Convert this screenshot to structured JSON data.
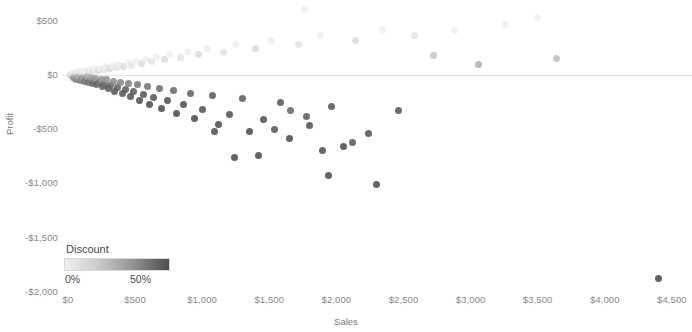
{
  "chart_data": {
    "type": "scatter",
    "title": "",
    "xlabel": "Sales",
    "ylabel": "Profit",
    "xlim": [
      0,
      4600
    ],
    "ylim": [
      -2000,
      700
    ],
    "grid": false,
    "zero_line": true,
    "x_ticks": [
      "$0",
      "$500",
      "$1,000",
      "$1,500",
      "$2,000",
      "$2,500",
      "$3,000",
      "$3,500",
      "$4,000",
      "$4,500"
    ],
    "x_tick_values": [
      0,
      500,
      1000,
      1500,
      2000,
      2500,
      3000,
      3500,
      4000,
      4500
    ],
    "y_ticks": [
      "$500",
      "$0",
      "-$500",
      "-$1,000",
      "-$1,500",
      "-$2,000"
    ],
    "y_tick_values": [
      500,
      0,
      -500,
      -1000,
      -1500,
      -2000
    ],
    "color_encoding": {
      "field": "Discount",
      "min_label": "0%",
      "max_label": "50%",
      "min_value": 0,
      "max_value": 50,
      "min_color": "#f0f0f0",
      "max_color": "#4f4f4f",
      "legend_position": "bottom-left"
    },
    "marker": {
      "shape": "circle",
      "size_px": 7,
      "opacity": 0.85
    },
    "series": [
      {
        "name": "Orders",
        "points": [
          {
            "x": 18,
            "y": 6,
            "d": 2
          },
          {
            "x": 22,
            "y": -4,
            "d": 6
          },
          {
            "x": 26,
            "y": 10,
            "d": 0
          },
          {
            "x": 30,
            "y": -14,
            "d": 14
          },
          {
            "x": 34,
            "y": 4,
            "d": 4
          },
          {
            "x": 38,
            "y": -22,
            "d": 20
          },
          {
            "x": 42,
            "y": 16,
            "d": 0
          },
          {
            "x": 46,
            "y": -8,
            "d": 12
          },
          {
            "x": 50,
            "y": -30,
            "d": 26
          },
          {
            "x": 54,
            "y": 12,
            "d": 2
          },
          {
            "x": 58,
            "y": -18,
            "d": 18
          },
          {
            "x": 62,
            "y": 22,
            "d": 0
          },
          {
            "x": 66,
            "y": -40,
            "d": 30
          },
          {
            "x": 70,
            "y": 8,
            "d": 6
          },
          {
            "x": 74,
            "y": -26,
            "d": 22
          },
          {
            "x": 80,
            "y": 30,
            "d": 0
          },
          {
            "x": 86,
            "y": -12,
            "d": 14
          },
          {
            "x": 92,
            "y": -48,
            "d": 32
          },
          {
            "x": 98,
            "y": 18,
            "d": 4
          },
          {
            "x": 104,
            "y": -34,
            "d": 26
          },
          {
            "x": 110,
            "y": 36,
            "d": 0
          },
          {
            "x": 116,
            "y": -20,
            "d": 18
          },
          {
            "x": 122,
            "y": -58,
            "d": 34
          },
          {
            "x": 128,
            "y": 24,
            "d": 2
          },
          {
            "x": 134,
            "y": -44,
            "d": 30
          },
          {
            "x": 140,
            "y": 42,
            "d": 0
          },
          {
            "x": 146,
            "y": -16,
            "d": 16
          },
          {
            "x": 152,
            "y": -66,
            "d": 36
          },
          {
            "x": 158,
            "y": 28,
            "d": 4
          },
          {
            "x": 164,
            "y": -52,
            "d": 32
          },
          {
            "x": 170,
            "y": 48,
            "d": 0
          },
          {
            "x": 176,
            "y": -24,
            "d": 20
          },
          {
            "x": 182,
            "y": -78,
            "d": 38
          },
          {
            "x": 188,
            "y": 34,
            "d": 2
          },
          {
            "x": 194,
            "y": -60,
            "d": 34
          },
          {
            "x": 200,
            "y": 56,
            "d": 0
          },
          {
            "x": 208,
            "y": -30,
            "d": 22
          },
          {
            "x": 216,
            "y": -92,
            "d": 40
          },
          {
            "x": 224,
            "y": 40,
            "d": 4
          },
          {
            "x": 232,
            "y": -72,
            "d": 36
          },
          {
            "x": 240,
            "y": 64,
            "d": 0
          },
          {
            "x": 248,
            "y": -38,
            "d": 24
          },
          {
            "x": 256,
            "y": -108,
            "d": 42
          },
          {
            "x": 264,
            "y": 48,
            "d": 2
          },
          {
            "x": 272,
            "y": -84,
            "d": 38
          },
          {
            "x": 280,
            "y": 74,
            "d": 0
          },
          {
            "x": 290,
            "y": -46,
            "d": 26
          },
          {
            "x": 300,
            "y": -126,
            "d": 44
          },
          {
            "x": 310,
            "y": 56,
            "d": 4
          },
          {
            "x": 320,
            "y": -98,
            "d": 40
          },
          {
            "x": 330,
            "y": 86,
            "d": 0
          },
          {
            "x": 340,
            "y": -56,
            "d": 28
          },
          {
            "x": 350,
            "y": -148,
            "d": 46
          },
          {
            "x": 360,
            "y": 66,
            "d": 2
          },
          {
            "x": 370,
            "y": -114,
            "d": 42
          },
          {
            "x": 380,
            "y": 98,
            "d": 0
          },
          {
            "x": 392,
            "y": -66,
            "d": 30
          },
          {
            "x": 404,
            "y": -172,
            "d": 46
          },
          {
            "x": 416,
            "y": 78,
            "d": 4
          },
          {
            "x": 428,
            "y": -132,
            "d": 44
          },
          {
            "x": 440,
            "y": 112,
            "d": 0
          },
          {
            "x": 452,
            "y": -78,
            "d": 32
          },
          {
            "x": 464,
            "y": -200,
            "d": 48
          },
          {
            "x": 476,
            "y": 92,
            "d": 2
          },
          {
            "x": 490,
            "y": -154,
            "d": 44
          },
          {
            "x": 504,
            "y": 128,
            "d": 0
          },
          {
            "x": 518,
            "y": -92,
            "d": 34
          },
          {
            "x": 532,
            "y": -232,
            "d": 48
          },
          {
            "x": 546,
            "y": 106,
            "d": 4
          },
          {
            "x": 560,
            "y": -178,
            "d": 46
          },
          {
            "x": 576,
            "y": 146,
            "d": 0
          },
          {
            "x": 592,
            "y": -108,
            "d": 36
          },
          {
            "x": 608,
            "y": -268,
            "d": 50
          },
          {
            "x": 624,
            "y": 124,
            "d": 2
          },
          {
            "x": 640,
            "y": -206,
            "d": 46
          },
          {
            "x": 660,
            "y": 166,
            "d": 0
          },
          {
            "x": 680,
            "y": -126,
            "d": 38
          },
          {
            "x": 700,
            "y": -308,
            "d": 50
          },
          {
            "x": 720,
            "y": 142,
            "d": 4
          },
          {
            "x": 740,
            "y": -238,
            "d": 48
          },
          {
            "x": 760,
            "y": 190,
            "d": 0
          },
          {
            "x": 785,
            "y": -146,
            "d": 40
          },
          {
            "x": 810,
            "y": -352,
            "d": 50
          },
          {
            "x": 835,
            "y": 162,
            "d": 2
          },
          {
            "x": 860,
            "y": -274,
            "d": 48
          },
          {
            "x": 888,
            "y": 216,
            "d": 0
          },
          {
            "x": 916,
            "y": -168,
            "d": 42
          },
          {
            "x": 944,
            "y": -402,
            "d": 50
          },
          {
            "x": 972,
            "y": 186,
            "d": 4
          },
          {
            "x": 1000,
            "y": -314,
            "d": 48
          },
          {
            "x": 1040,
            "y": 246,
            "d": 0
          },
          {
            "x": 1080,
            "y": -192,
            "d": 44
          },
          {
            "x": 1120,
            "y": -458,
            "d": 50
          },
          {
            "x": 1160,
            "y": 212,
            "d": 2
          },
          {
            "x": 1200,
            "y": -360,
            "d": 48
          },
          {
            "x": 1250,
            "y": 282,
            "d": 0
          },
          {
            "x": 1300,
            "y": -220,
            "d": 44
          },
          {
            "x": 1350,
            "y": -520,
            "d": 50
          },
          {
            "x": 1400,
            "y": 244,
            "d": 4
          },
          {
            "x": 1460,
            "y": -412,
            "d": 48
          },
          {
            "x": 1520,
            "y": 322,
            "d": 0
          },
          {
            "x": 1580,
            "y": -252,
            "d": 46
          },
          {
            "x": 1650,
            "y": -588,
            "d": 50
          },
          {
            "x": 1720,
            "y": 280,
            "d": 2
          },
          {
            "x": 1800,
            "y": -470,
            "d": 48
          },
          {
            "x": 1880,
            "y": 368,
            "d": 0
          },
          {
            "x": 1960,
            "y": -288,
            "d": 46
          },
          {
            "x": 2050,
            "y": -664,
            "d": 50
          },
          {
            "x": 2140,
            "y": 320,
            "d": 4
          },
          {
            "x": 2240,
            "y": -536,
            "d": 48
          },
          {
            "x": 2340,
            "y": 420,
            "d": 0
          },
          {
            "x": 2460,
            "y": -330,
            "d": 46
          },
          {
            "x": 2580,
            "y": 364,
            "d": 2
          },
          {
            "x": 2720,
            "y": 180,
            "d": 10
          },
          {
            "x": 2880,
            "y": 412,
            "d": 0
          },
          {
            "x": 3060,
            "y": 96,
            "d": 16
          },
          {
            "x": 3260,
            "y": 468,
            "d": 0
          },
          {
            "x": 3500,
            "y": 530,
            "d": 0
          },
          {
            "x": 3640,
            "y": 148,
            "d": 12
          },
          {
            "x": 4400,
            "y": -1880,
            "d": 50
          },
          {
            "x": 1760,
            "y": 600,
            "d": 0
          },
          {
            "x": 1940,
            "y": -930,
            "d": 50
          },
          {
            "x": 2300,
            "y": -1010,
            "d": 50
          },
          {
            "x": 1900,
            "y": -700,
            "d": 48
          },
          {
            "x": 2120,
            "y": -620,
            "d": 46
          },
          {
            "x": 1240,
            "y": -760,
            "d": 50
          },
          {
            "x": 1420,
            "y": -740,
            "d": 50
          },
          {
            "x": 1090,
            "y": -520,
            "d": 48
          },
          {
            "x": 1540,
            "y": -500,
            "d": 46
          },
          {
            "x": 1660,
            "y": -330,
            "d": 40
          },
          {
            "x": 1780,
            "y": -380,
            "d": 44
          }
        ]
      }
    ]
  },
  "legend": {
    "title": "Discount",
    "min_label": "0%",
    "max_label": "50%"
  },
  "axes": {
    "x_title": "Sales",
    "y_title": "Profit"
  }
}
